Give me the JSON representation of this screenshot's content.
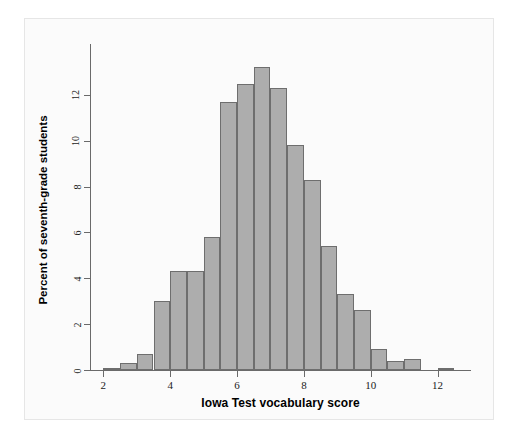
{
  "chart_data": {
    "type": "bar",
    "title": "",
    "subtitle": "",
    "xlabel": "Iowa Test vocabulary score",
    "ylabel": "Percent of seventh-grade students",
    "xlim": [
      1.6,
      13.0
    ],
    "ylim": [
      0,
      13.7
    ],
    "grid": false,
    "legend": null,
    "bin_width": 0.5,
    "x_tick_labels": [
      "2",
      "4",
      "6",
      "8",
      "10",
      "12"
    ],
    "x_tick_values": [
      2,
      4,
      6,
      8,
      10,
      12
    ],
    "y_tick_labels": [
      "0",
      "2",
      "4",
      "6",
      "8",
      "10",
      "12"
    ],
    "y_tick_values": [
      0,
      2,
      4,
      6,
      8,
      10,
      12
    ],
    "bin_starts": [
      2.0,
      2.5,
      3.0,
      3.5,
      4.0,
      4.5,
      5.0,
      5.5,
      6.0,
      6.5,
      7.0,
      7.5,
      8.0,
      8.5,
      9.0,
      9.5,
      10.0,
      10.5,
      11.0,
      11.5,
      12.0
    ],
    "categories": [
      "2.0-2.5",
      "2.5-3.0",
      "3.0-3.5",
      "3.5-4.0",
      "4.0-4.5",
      "4.5-5.0",
      "5.0-5.5",
      "5.5-6.0",
      "6.0-6.5",
      "6.5-7.0",
      "7.0-7.5",
      "7.5-8.0",
      "8.0-8.5",
      "8.5-9.0",
      "9.0-9.5",
      "9.5-10.0",
      "10.0-10.5",
      "10.5-11.0",
      "11.0-11.5",
      "11.5-12.0",
      "12.0-12.5"
    ],
    "values": [
      0.1,
      0.3,
      0.7,
      3.0,
      4.3,
      4.3,
      5.8,
      11.7,
      12.5,
      13.2,
      12.3,
      9.8,
      8.3,
      5.4,
      3.3,
      2.6,
      0.9,
      0.4,
      0.5,
      0.0,
      0.1
    ],
    "bar_color": "#adadad",
    "bar_edge_color": "#6e6e6e",
    "axis_color": "#6a6a6a",
    "background_color": "#ffffff"
  }
}
